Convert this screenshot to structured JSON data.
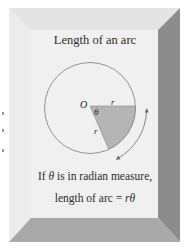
{
  "figure": {
    "title": "Length of an arc",
    "caption_line1_pre": "If ",
    "caption_line1_symbol": "θ",
    "caption_line1_post": " is in radian measure,",
    "caption_line2_pre": "length of arc = ",
    "caption_line2_formula": "rθ"
  },
  "diagram": {
    "center_label": "O",
    "radius_label_top": "r",
    "radius_label_side": "r",
    "angle_label": "θ",
    "arc_arrow": "double-headed-arc-arrow"
  },
  "colors": {
    "panel_face": "#efefef",
    "bevel_top": "#e6e6e6",
    "bevel_left": "#ebebeb",
    "bevel_right": "#8c8c8c",
    "bevel_bottom": "#a9a9a9",
    "sector_fill": "#b5b5b5",
    "circle_stroke": "#7a7a7a",
    "text": "#2b2b2b"
  }
}
